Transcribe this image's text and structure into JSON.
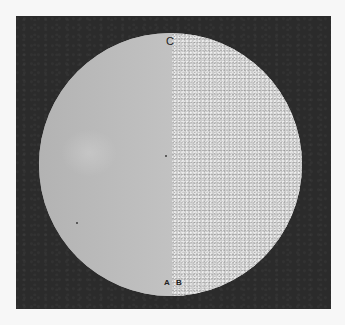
{
  "image": {
    "description": "Photograph of a circular specimen disc on a dark background; left half smooth, right half finely textured",
    "labels": {
      "top": "C",
      "bottom_left": "A",
      "bottom_right": "B"
    },
    "colors": {
      "background": "#f7f7f7",
      "frame": "#2b2b2b",
      "disc_smooth": "#b9b9b9",
      "disc_textured": "#cdcdcd"
    }
  }
}
